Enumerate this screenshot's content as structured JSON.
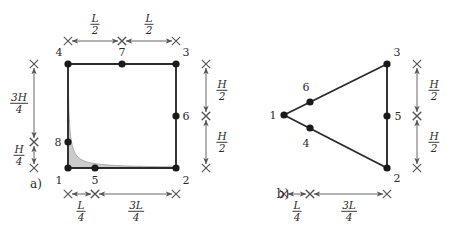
{
  "figure": {
    "background_color": "#ffffff",
    "line_color": "#2b2b2b",
    "dim_line_color": "#555555",
    "node_color": "#1a1a1a",
    "shade_fill_color": "#c9c9c9",
    "shade_edge_color": "#8c8c8c",
    "width": 454,
    "height": 230
  },
  "panels": [
    {
      "key": "a",
      "label": "a)",
      "label_x": 36,
      "label_y": 184,
      "shape": "quadrilateral",
      "nodes": [
        {
          "id": "1",
          "x": 68,
          "y": 168,
          "label": "1",
          "label_x": 59,
          "label_y": 180
        },
        {
          "id": "2",
          "x": 176,
          "y": 168,
          "label": "2",
          "label_x": 186,
          "label_y": 180
        },
        {
          "id": "3",
          "x": 176,
          "y": 64,
          "label": "3",
          "label_x": 186,
          "label_y": 52
        },
        {
          "id": "4",
          "x": 68,
          "y": 64,
          "label": "4",
          "label_x": 59,
          "label_y": 52
        },
        {
          "id": "5",
          "x": 95,
          "y": 168,
          "label": "5",
          "label_x": 95,
          "label_y": 180
        },
        {
          "id": "6",
          "x": 176,
          "y": 116,
          "label": "6",
          "label_x": 186,
          "label_y": 116
        },
        {
          "id": "7",
          "x": 122,
          "y": 64,
          "label": "7",
          "label_x": 122,
          "label_y": 52
        },
        {
          "id": "8",
          "x": 68,
          "y": 142,
          "label": "8",
          "label_x": 58,
          "label_y": 142
        }
      ],
      "edges": [
        [
          "1",
          "2"
        ],
        [
          "2",
          "3"
        ],
        [
          "3",
          "4"
        ],
        [
          "4",
          "1"
        ]
      ],
      "shaded_region": {
        "present": true,
        "description": "hyperbolic wedge in lower-left corner bounded by node 4 side, node 8 and node 1-2 edge"
      },
      "dimensions": [
        {
          "id": "top-left",
          "orientation": "horizontal",
          "numerator": "L",
          "denominator": "2",
          "x1": 68,
          "x2": 122,
          "y": 41,
          "label_x": 95,
          "label_y": 24
        },
        {
          "id": "top-right",
          "orientation": "horizontal",
          "numerator": "L",
          "denominator": "2",
          "x1": 122,
          "x2": 176,
          "y": 41,
          "label_x": 149,
          "label_y": 24
        },
        {
          "id": "left-upper",
          "orientation": "vertical",
          "numerator": "3H",
          "denominator": "4",
          "y1": 64,
          "y2": 142,
          "x": 34,
          "label_x": 19,
          "label_y": 103
        },
        {
          "id": "left-lower",
          "orientation": "vertical",
          "numerator": "H",
          "denominator": "4",
          "y1": 142,
          "y2": 168,
          "x": 34,
          "label_x": 19,
          "label_y": 155
        },
        {
          "id": "right-upper",
          "orientation": "vertical",
          "numerator": "H",
          "denominator": "2",
          "y1": 64,
          "y2": 116,
          "x": 206,
          "label_x": 222,
          "label_y": 90
        },
        {
          "id": "right-lower",
          "orientation": "vertical",
          "numerator": "H",
          "denominator": "2",
          "y1": 116,
          "y2": 168,
          "x": 206,
          "label_x": 222,
          "label_y": 142
        },
        {
          "id": "bottom-left",
          "orientation": "horizontal",
          "numerator": "L",
          "denominator": "4",
          "x1": 68,
          "x2": 95,
          "y": 194,
          "label_x": 81,
          "label_y": 211
        },
        {
          "id": "bottom-right",
          "orientation": "horizontal",
          "numerator": "3L",
          "denominator": "4",
          "x1": 95,
          "x2": 176,
          "y": 194,
          "label_x": 136,
          "label_y": 211
        }
      ]
    },
    {
      "key": "b",
      "label": "b)",
      "label_x": 283,
      "label_y": 194,
      "shape": "triangle",
      "nodes": [
        {
          "id": "1",
          "x": 284,
          "y": 115,
          "label": "1",
          "label_x": 273,
          "label_y": 115
        },
        {
          "id": "2",
          "x": 387,
          "y": 168,
          "label": "2",
          "label_x": 397,
          "label_y": 178
        },
        {
          "id": "3",
          "x": 387,
          "y": 64,
          "label": "3",
          "label_x": 397,
          "label_y": 52
        },
        {
          "id": "4",
          "x": 310,
          "y": 128,
          "label": "4",
          "label_x": 306,
          "label_y": 143
        },
        {
          "id": "5",
          "x": 387,
          "y": 116,
          "label": "5",
          "label_x": 398,
          "label_y": 116
        },
        {
          "id": "6",
          "x": 310,
          "y": 102,
          "label": "6",
          "label_x": 306,
          "label_y": 87
        }
      ],
      "edges": [
        [
          "1",
          "3"
        ],
        [
          "3",
          "2"
        ],
        [
          "2",
          "1"
        ]
      ],
      "shaded_region": {
        "present": false
      },
      "dimensions": [
        {
          "id": "right-upper",
          "orientation": "vertical",
          "numerator": "H",
          "denominator": "2",
          "y1": 64,
          "y2": 116,
          "x": 417,
          "label_x": 434,
          "label_y": 90
        },
        {
          "id": "right-lower",
          "orientation": "vertical",
          "numerator": "H",
          "denominator": "2",
          "y1": 116,
          "y2": 168,
          "x": 417,
          "label_x": 434,
          "label_y": 142
        },
        {
          "id": "bottom-left",
          "orientation": "horizontal",
          "numerator": "L",
          "denominator": "4",
          "x1": 284,
          "x2": 310,
          "y": 194,
          "label_x": 297,
          "label_y": 211
        },
        {
          "id": "bottom-right",
          "orientation": "horizontal",
          "numerator": "3L",
          "denominator": "4",
          "x1": 310,
          "x2": 387,
          "y": 194,
          "label_x": 349,
          "label_y": 211
        }
      ]
    }
  ]
}
